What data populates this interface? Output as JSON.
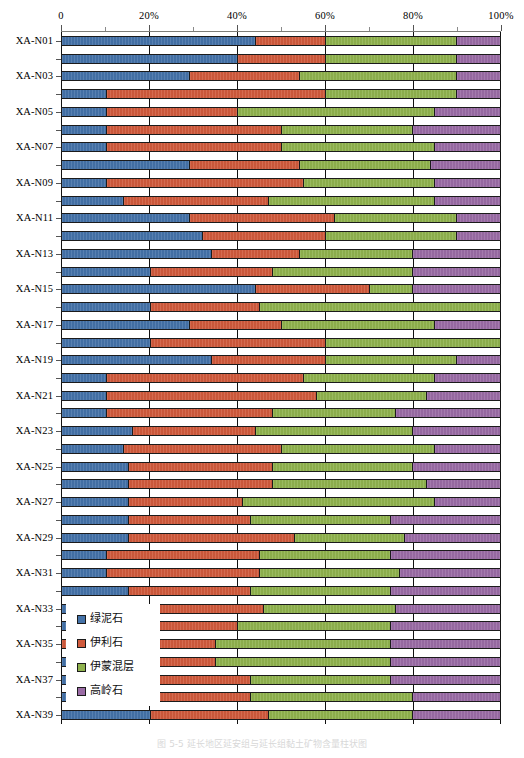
{
  "chart_data": {
    "type": "bar",
    "orientation": "horizontal",
    "stacked": true,
    "normalized_percent": true,
    "title": "",
    "xlabel": "",
    "ylabel": "",
    "xlim": [
      0,
      100
    ],
    "grid": true,
    "legend_position": "inside-lower-left",
    "xticks": [
      0,
      20,
      40,
      60,
      80,
      100
    ],
    "xtick_labels": [
      "0",
      "20%",
      "40%",
      "60%",
      "80%",
      "100%"
    ],
    "minor_xticks": [
      10,
      30,
      50,
      70,
      90
    ],
    "series": [
      {
        "name": "绿泥石",
        "color": "#4472a8"
      },
      {
        "name": "伊利石",
        "color": "#d05a3c"
      },
      {
        "name": "伊蒙混层",
        "color": "#8fb24d"
      },
      {
        "name": "高岭石",
        "color": "#9a6ba5"
      }
    ],
    "categories": [
      "XA-N01",
      "XA-N02",
      "XA-N03",
      "XA-N04",
      "XA-N05",
      "XA-N06",
      "XA-N07",
      "XA-N08",
      "XA-N09",
      "XA-N10",
      "XA-N11",
      "XA-N12",
      "XA-N13",
      "XA-N14",
      "XA-N15",
      "XA-N16",
      "XA-N17",
      "XA-N18",
      "XA-N19",
      "XA-N20",
      "XA-N21",
      "XA-N22",
      "XA-N23",
      "XA-N24",
      "XA-N25",
      "XA-N26",
      "XA-N27",
      "XA-N28",
      "XA-N29",
      "XA-N30",
      "XA-N31",
      "XA-N32",
      "XA-N33",
      "XA-N34",
      "XA-N35",
      "XA-N36",
      "XA-N37",
      "XA-N38",
      "XA-N39"
    ],
    "visible_category_labels": [
      "XA-N01",
      "XA-N03",
      "XA-N05",
      "XA-N07",
      "XA-N09",
      "XA-N11",
      "XA-N13",
      "XA-N15",
      "XA-N17",
      "XA-N19",
      "XA-N21",
      "XA-N23",
      "XA-N25",
      "XA-N27",
      "XA-N29",
      "XA-N31",
      "XA-N33",
      "XA-N35",
      "XA-N37",
      "XA-N39"
    ],
    "rows": [
      {
        "category": "XA-N01",
        "values": [
          44,
          16,
          30,
          10
        ]
      },
      {
        "category": "XA-N02",
        "values": [
          40,
          20,
          30,
          10
        ]
      },
      {
        "category": "XA-N03",
        "values": [
          29,
          25,
          36,
          10
        ]
      },
      {
        "category": "XA-N04",
        "values": [
          10,
          50,
          30,
          10
        ]
      },
      {
        "category": "XA-N05",
        "values": [
          10,
          30,
          45,
          15
        ]
      },
      {
        "category": "XA-N06",
        "values": [
          10,
          40,
          30,
          20
        ]
      },
      {
        "category": "XA-N07",
        "values": [
          10,
          40,
          35,
          15
        ]
      },
      {
        "category": "XA-N08",
        "values": [
          29,
          25,
          30,
          16
        ]
      },
      {
        "category": "XA-N09",
        "values": [
          10,
          45,
          30,
          15
        ]
      },
      {
        "category": "XA-N10",
        "values": [
          14,
          33,
          38,
          15
        ]
      },
      {
        "category": "XA-N11",
        "values": [
          29,
          33,
          28,
          10
        ]
      },
      {
        "category": "XA-N12",
        "values": [
          32,
          28,
          30,
          10
        ]
      },
      {
        "category": "XA-N13",
        "values": [
          34,
          20,
          26,
          20
        ]
      },
      {
        "category": "XA-N14",
        "values": [
          20,
          28,
          32,
          20
        ]
      },
      {
        "category": "XA-N15",
        "values": [
          44,
          26,
          10,
          20
        ]
      },
      {
        "category": "XA-N16",
        "values": [
          20,
          25,
          55,
          0
        ]
      },
      {
        "category": "XA-N17",
        "values": [
          29,
          21,
          35,
          15
        ]
      },
      {
        "category": "XA-N18",
        "values": [
          20,
          40,
          40,
          0
        ]
      },
      {
        "category": "XA-N19",
        "values": [
          34,
          26,
          30,
          10
        ]
      },
      {
        "category": "XA-N20",
        "values": [
          10,
          45,
          30,
          15
        ]
      },
      {
        "category": "XA-N21",
        "values": [
          10,
          48,
          25,
          17
        ]
      },
      {
        "category": "XA-N22",
        "values": [
          10,
          38,
          28,
          24
        ]
      },
      {
        "category": "XA-N23",
        "values": [
          16,
          28,
          36,
          20
        ]
      },
      {
        "category": "XA-N24",
        "values": [
          14,
          36,
          35,
          15
        ]
      },
      {
        "category": "XA-N25",
        "values": [
          15,
          33,
          32,
          20
        ]
      },
      {
        "category": "XA-N26",
        "values": [
          15,
          33,
          35,
          17
        ]
      },
      {
        "category": "XA-N27",
        "values": [
          15,
          26,
          44,
          15
        ]
      },
      {
        "category": "XA-N28",
        "values": [
          15,
          28,
          32,
          25
        ]
      },
      {
        "category": "XA-N29",
        "values": [
          15,
          38,
          25,
          22
        ]
      },
      {
        "category": "XA-N30",
        "values": [
          10,
          35,
          30,
          25
        ]
      },
      {
        "category": "XA-N31",
        "values": [
          10,
          35,
          32,
          23
        ]
      },
      {
        "category": "XA-N32",
        "values": [
          15,
          28,
          32,
          25
        ]
      },
      {
        "category": "XA-N33",
        "values": [
          15,
          31,
          30,
          24
        ]
      },
      {
        "category": "XA-N34",
        "values": [
          9,
          31,
          35,
          25
        ]
      },
      {
        "category": "XA-N35",
        "values": [
          0,
          35,
          40,
          25
        ]
      },
      {
        "category": "XA-N36",
        "values": [
          2,
          33,
          40,
          25
        ]
      },
      {
        "category": "XA-N37",
        "values": [
          9,
          34,
          32,
          25
        ]
      },
      {
        "category": "XA-N38",
        "values": [
          20,
          23,
          37,
          20
        ]
      },
      {
        "category": "XA-N39",
        "values": [
          20,
          27,
          33,
          20
        ]
      }
    ]
  },
  "legend": {
    "items": [
      {
        "label": "绿泥石",
        "color": "#4472a8"
      },
      {
        "label": "伊利石",
        "color": "#d05a3c"
      },
      {
        "label": "伊蒙混层",
        "color": "#8fb24d"
      },
      {
        "label": "高岭石",
        "color": "#9a6ba5"
      }
    ]
  },
  "caption": {
    "text": "图 5-5  延长地区延安组与延长组黏土矿物含量柱状图"
  }
}
